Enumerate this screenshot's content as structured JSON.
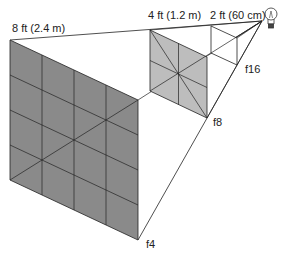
{
  "diagram": {
    "colors": {
      "large_fill": "#8a8a8a",
      "medium_fill": "#bdbdbd",
      "small_fill": "#ffffff",
      "line": "#222222"
    },
    "labels": {
      "distance_large": "8 ft (2.4 m)",
      "distance_medium": "4 ft (1.2 m)",
      "distance_small": "2 ft (60 cm)",
      "aperture_large": "f4",
      "aperture_medium": "f8",
      "aperture_small": "f16"
    },
    "icons": [
      "light-bulb-icon"
    ]
  }
}
